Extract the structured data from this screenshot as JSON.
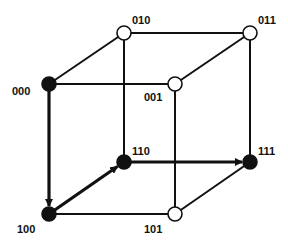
{
  "diagram": {
    "type": "binary-cube",
    "nodes": [
      {
        "id": "000",
        "label": "000",
        "x": 49,
        "y": 84,
        "filled": true,
        "lx": 12,
        "ly": 95
      },
      {
        "id": "010",
        "label": "010",
        "x": 124,
        "y": 33,
        "filled": false,
        "lx": 132,
        "ly": 24
      },
      {
        "id": "011",
        "label": "011",
        "x": 250,
        "y": 33,
        "filled": false,
        "lx": 258,
        "ly": 24
      },
      {
        "id": "001",
        "label": "001",
        "x": 175,
        "y": 84,
        "filled": false,
        "lx": 144,
        "ly": 101
      },
      {
        "id": "110",
        "label": "110",
        "x": 124,
        "y": 162,
        "filled": true,
        "lx": 132,
        "ly": 155
      },
      {
        "id": "111",
        "label": "111",
        "x": 250,
        "y": 162,
        "filled": true,
        "lx": 258,
        "ly": 155
      },
      {
        "id": "100",
        "label": "100",
        "x": 49,
        "y": 214,
        "filled": true,
        "lx": 17,
        "ly": 233
      },
      {
        "id": "101",
        "label": "101",
        "x": 175,
        "y": 214,
        "filled": false,
        "lx": 144,
        "ly": 233
      }
    ],
    "edges": [
      {
        "from": "000",
        "to": "010",
        "bold": false,
        "arrow": false
      },
      {
        "from": "010",
        "to": "011",
        "bold": false,
        "arrow": false
      },
      {
        "from": "000",
        "to": "001",
        "bold": false,
        "arrow": false
      },
      {
        "from": "001",
        "to": "011",
        "bold": false,
        "arrow": false
      },
      {
        "from": "010",
        "to": "110",
        "bold": false,
        "arrow": false
      },
      {
        "from": "011",
        "to": "111",
        "bold": false,
        "arrow": false
      },
      {
        "from": "001",
        "to": "101",
        "bold": false,
        "arrow": false
      },
      {
        "from": "100",
        "to": "101",
        "bold": false,
        "arrow": false
      },
      {
        "from": "101",
        "to": "111",
        "bold": false,
        "arrow": false
      },
      {
        "from": "000",
        "to": "100",
        "bold": true,
        "arrow": true
      },
      {
        "from": "100",
        "to": "110",
        "bold": true,
        "arrow": true
      },
      {
        "from": "110",
        "to": "111",
        "bold": true,
        "arrow": true
      }
    ],
    "colors": {
      "line": "#111111",
      "filled": "#111111",
      "hollow": "#ffffff"
    }
  }
}
